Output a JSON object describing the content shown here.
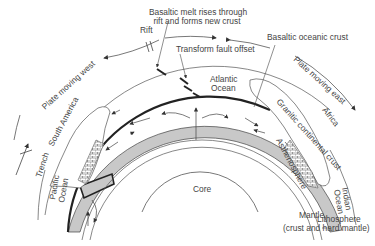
{
  "diagram": {
    "labels": {
      "basaltic_melt_line1": "Basaltic melt rises through",
      "basaltic_melt_line2": "rift and forms new crust",
      "rift": "Rift",
      "transform_fault": "Transform fault  offset",
      "basaltic_oceanic_crust": "Basaltic oceanic crust",
      "plate_moving_west": "Plate moving west",
      "plate_moving_east": "Plate moving east",
      "atlantic_ocean_line1": "Atlantic",
      "atlantic_ocean_line2": "Ocean",
      "south_america": "South America",
      "africa": "Africa",
      "granitic_continental_crust": "Granitic continental crust",
      "asthenosphere": "Asthenosphere",
      "trench": "Trench",
      "pacific_ocean_line1": "Pacific",
      "pacific_ocean_line2": "Ocean",
      "core": "Core",
      "mantle": "Mantle",
      "indian_ocean_line1": "Indian",
      "indian_ocean_line2": "Ocean",
      "lithosphere_line1": "Lithosphere",
      "lithosphere_line2": "(crust and hard mantle)"
    },
    "colors": {
      "line": "#444444",
      "plate_fill": "#c8c8c8",
      "plate_edge": "#222222",
      "text": "#444444"
    }
  }
}
